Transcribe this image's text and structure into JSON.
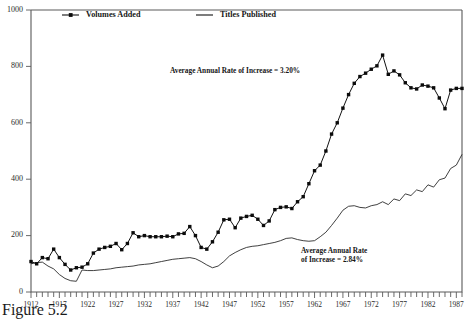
{
  "figure": {
    "caption": "Figure 5.2",
    "legend": [
      {
        "label": "Volumes Added",
        "marker": "square-line-marker",
        "color": "#111111"
      },
      {
        "label": "Titles Published",
        "marker": "plain-line-marker",
        "color": "#1d1d1d"
      }
    ],
    "annotations": [
      {
        "name": "volumes-growth-annotation",
        "text": "Average Annual Rate of Increase = 3.20%",
        "x": 170,
        "y": 73
      },
      {
        "name": "titles-growth-annotation-line1",
        "text": "Average Annual Rate",
        "x": 301,
        "y": 253
      },
      {
        "name": "titles-growth-annotation-line2",
        "text": "of Increase = 2.84%",
        "x": 301,
        "y": 262
      }
    ]
  },
  "chart_data": {
    "type": "line",
    "title": "",
    "subtitle": "",
    "xlabel": "",
    "ylabel": "",
    "grid": false,
    "legend_position": "top",
    "xlim": [
      1912,
      1988
    ],
    "ylim": [
      0,
      1000
    ],
    "ytick_labels": [
      "0",
      "200",
      "400",
      "600",
      "800",
      "1000"
    ],
    "ytick_values": [
      0,
      200,
      400,
      600,
      800,
      1000
    ],
    "xtick_labels": [
      "1912",
      "1917",
      "1922",
      "1927",
      "1932",
      "1937",
      "1942",
      "1947",
      "1952",
      "1957",
      "1962",
      "1967",
      "1972",
      "1977",
      "1982",
      "1987"
    ],
    "xtick_values": [
      1912,
      1917,
      1922,
      1927,
      1932,
      1937,
      1942,
      1947,
      1952,
      1957,
      1962,
      1967,
      1972,
      1977,
      1982,
      1987
    ],
    "xminor_step": 1,
    "x": [
      1912,
      1913,
      1914,
      1915,
      1916,
      1917,
      1918,
      1919,
      1920,
      1921,
      1922,
      1923,
      1924,
      1925,
      1926,
      1927,
      1928,
      1929,
      1930,
      1931,
      1932,
      1933,
      1934,
      1935,
      1936,
      1937,
      1938,
      1939,
      1940,
      1941,
      1942,
      1943,
      1944,
      1945,
      1946,
      1947,
      1948,
      1949,
      1950,
      1951,
      1952,
      1953,
      1954,
      1955,
      1956,
      1957,
      1958,
      1959,
      1960,
      1961,
      1962,
      1963,
      1964,
      1965,
      1966,
      1967,
      1968,
      1969,
      1970,
      1971,
      1972,
      1973,
      1974,
      1975,
      1976,
      1977,
      1978,
      1979,
      1980,
      1981,
      1982,
      1983,
      1984,
      1985,
      1986,
      1987,
      1988
    ],
    "series": [
      {
        "name": "Volumes Added",
        "markers": true,
        "values": [
          108,
          100,
          122,
          118,
          152,
          122,
          98,
          78,
          86,
          88,
          100,
          138,
          152,
          158,
          162,
          172,
          150,
          172,
          210,
          196,
          200,
          196,
          196,
          196,
          198,
          196,
          206,
          208,
          232,
          200,
          158,
          152,
          178,
          212,
          256,
          258,
          228,
          262,
          268,
          272,
          258,
          236,
          252,
          292,
          300,
          302,
          296,
          320,
          338,
          384,
          430,
          450,
          500,
          560,
          600,
          652,
          700,
          740,
          764,
          776,
          790,
          802,
          840,
          772,
          784,
          770,
          742,
          724,
          720,
          734,
          730,
          724,
          688,
          650,
          716,
          722,
          722
        ]
      },
      {
        "name": "Titles Published",
        "markers": false,
        "values": [
          100,
          104,
          106,
          92,
          82,
          62,
          48,
          40,
          38,
          78,
          76,
          76,
          78,
          80,
          82,
          86,
          88,
          90,
          92,
          96,
          98,
          100,
          104,
          108,
          112,
          116,
          118,
          120,
          122,
          118,
          108,
          96,
          86,
          92,
          108,
          128,
          140,
          150,
          158,
          162,
          164,
          168,
          172,
          176,
          182,
          190,
          192,
          186,
          182,
          180,
          182,
          196,
          212,
          236,
          262,
          290,
          304,
          306,
          300,
          298,
          306,
          310,
          320,
          310,
          330,
          324,
          348,
          342,
          362,
          356,
          380,
          372,
          398,
          404,
          438,
          450,
          488
        ]
      }
    ]
  }
}
